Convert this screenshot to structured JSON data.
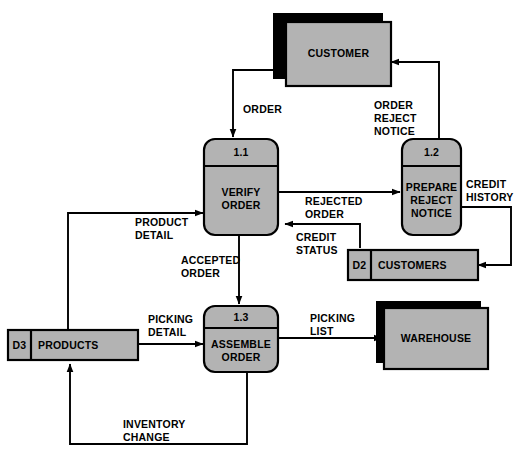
{
  "diagram": {
    "type": "data-flow-diagram",
    "fill_color": "#b3b3b3",
    "shadow_color": "#000000",
    "line_color": "#000000",
    "background": "#ffffff"
  },
  "entities": [
    {
      "id": "customer",
      "label": "CUSTOMER",
      "shape": "external-entity"
    },
    {
      "id": "warehouse",
      "label": "WAREHOUSE",
      "shape": "external-entity"
    }
  ],
  "processes": [
    {
      "id": "p11",
      "number": "1.1",
      "label_line1": "VERIFY",
      "label_line2": "ORDER",
      "label_line3": ""
    },
    {
      "id": "p12",
      "number": "1.2",
      "label_line1": "PREPARE",
      "label_line2": "REJECT",
      "label_line3": "NOTICE"
    },
    {
      "id": "p13",
      "number": "1.3",
      "label_line1": "ASSEMBLE",
      "label_line2": "ORDER",
      "label_line3": ""
    }
  ],
  "datastores": [
    {
      "id": "d2",
      "code": "D2",
      "label": "CUSTOMERS"
    },
    {
      "id": "d3",
      "code": "D3",
      "label": "PRODUCTS"
    }
  ],
  "flows": [
    {
      "id": "order",
      "line1": "ORDER",
      "line2": "",
      "from": "customer",
      "to": "p11"
    },
    {
      "id": "order_reject",
      "line1": "ORDER",
      "line2": "REJECT",
      "line3": "NOTICE",
      "from": "p12",
      "to": "customer"
    },
    {
      "id": "rejected_order",
      "line1": "REJECTED",
      "line2": "ORDER",
      "from": "p11",
      "to": "p12"
    },
    {
      "id": "credit_history",
      "line1": "CREDIT",
      "line2": "HISTORY",
      "from": "p12",
      "to": "d2"
    },
    {
      "id": "credit_status",
      "line1": "CREDIT",
      "line2": "STATUS",
      "from": "d2",
      "to": "p11"
    },
    {
      "id": "product_detail",
      "line1": "PRODUCT",
      "line2": "DETAIL",
      "from": "d3",
      "to": "p11"
    },
    {
      "id": "accepted_order",
      "line1": "ACCEPTED",
      "line2": "ORDER",
      "from": "p11",
      "to": "p13"
    },
    {
      "id": "picking_detail",
      "line1": "PICKING",
      "line2": "DETAIL",
      "from": "d3",
      "to": "p13"
    },
    {
      "id": "picking_list",
      "line1": "PICKING",
      "line2": "LIST",
      "from": "p13",
      "to": "warehouse"
    },
    {
      "id": "inventory_change",
      "line1": "INVENTORY",
      "line2": "CHANGE",
      "from": "p13",
      "to": "d3"
    }
  ]
}
